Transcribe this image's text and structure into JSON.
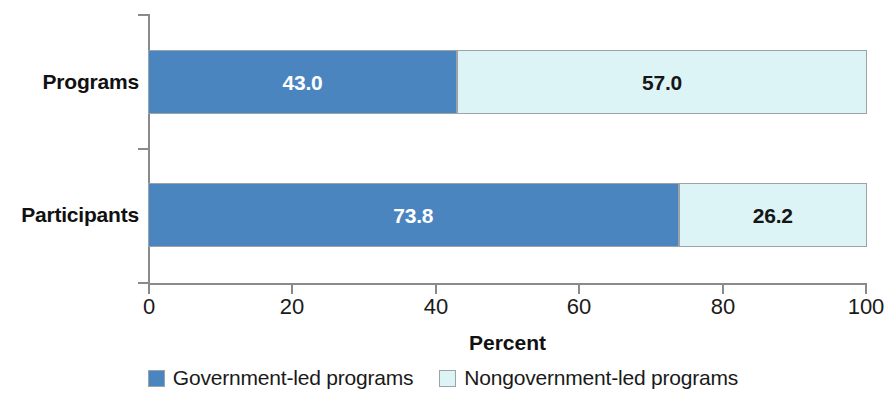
{
  "chart_data": {
    "type": "bar",
    "subtype": "stacked-horizontal-100",
    "title": "",
    "xlabel": "Percent",
    "ylabel": "",
    "categories": [
      "Programs",
      "Participants"
    ],
    "series": [
      {
        "name": "Government-led programs",
        "color": "#4a85bf",
        "values": [
          43.0,
          73.8
        ],
        "labels": [
          "43.0",
          "73.8"
        ]
      },
      {
        "name": "Nongovernment-led programs",
        "color": "#ddf4f7",
        "values": [
          57.0,
          26.2
        ],
        "labels": [
          "57.0",
          "26.2"
        ]
      }
    ],
    "xlim": [
      0,
      100
    ],
    "xticks": [
      0,
      20,
      40,
      60,
      80,
      100
    ],
    "xtick_labels": [
      "0",
      "20",
      "40",
      "60",
      "80",
      "100"
    ],
    "grid": false,
    "legend_position": "bottom"
  },
  "axis": {
    "x_title": "Percent",
    "ticks": [
      {
        "value": 0,
        "label": "0"
      },
      {
        "value": 20,
        "label": "20"
      },
      {
        "value": 40,
        "label": "40"
      },
      {
        "value": 60,
        "label": "60"
      },
      {
        "value": 80,
        "label": "80"
      },
      {
        "value": 100,
        "label": "100"
      }
    ]
  },
  "rows": [
    {
      "category": "Programs",
      "segments": [
        {
          "series": "Government-led programs",
          "value": 43.0,
          "label": "43.0"
        },
        {
          "series": "Nongovernment-led programs",
          "value": 57.0,
          "label": "57.0"
        }
      ]
    },
    {
      "category": "Participants",
      "segments": [
        {
          "series": "Government-led programs",
          "value": 73.8,
          "label": "73.8"
        },
        {
          "series": "Nongovernment-led programs",
          "value": 26.2,
          "label": "26.2"
        }
      ]
    }
  ],
  "legend": {
    "items": [
      {
        "label": "Government-led programs",
        "color": "#4a85bf"
      },
      {
        "label": "Nongovernment-led programs",
        "color": "#ddf4f7"
      }
    ]
  },
  "colors": {
    "government": "#4a85bf",
    "nongovernment": "#ddf4f7",
    "axis": "#8a8a8a",
    "text": "#1a1a1a",
    "background": "#ffffff"
  }
}
